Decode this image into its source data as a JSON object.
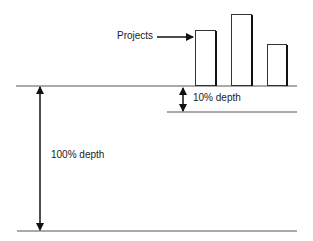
{
  "diagram": {
    "labels": {
      "projects": "Projects",
      "shallow_depth": "10% depth",
      "full_depth": "100% depth"
    },
    "bars": [
      {
        "name": "project-1",
        "relative_height": 55
      },
      {
        "name": "project-2",
        "relative_height": 71
      },
      {
        "name": "project-3",
        "relative_height": 41
      }
    ],
    "colors": {
      "line": "#555555",
      "arrow": "#111111",
      "bar_stroke": "#333333",
      "bar_fill": "#ffffff"
    }
  }
}
